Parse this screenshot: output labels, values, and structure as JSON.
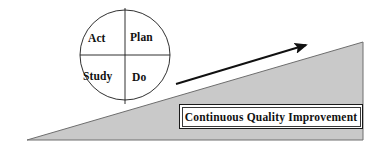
{
  "figure": {
    "background_color": "#ffffff"
  },
  "pdsa_cycle": {
    "name": "PDSA cycle wheel",
    "center_x": 125,
    "center_y": 55,
    "radius": 45,
    "stroke_color": "#1a1a1a",
    "fill_color": "#ffffff",
    "quadrants": [
      {
        "id": "act",
        "label": "Act",
        "position": "top-left"
      },
      {
        "id": "plan",
        "label": "Plan",
        "position": "top-right"
      },
      {
        "id": "study",
        "label": "Study",
        "position": "bottom-left"
      },
      {
        "id": "do",
        "label": "Do",
        "position": "bottom-right"
      }
    ]
  },
  "ramp": {
    "name": "improvement ramp",
    "fill_color": "#c9c9c9",
    "stroke_color": "#6e6e6e",
    "points": "27,140 363,140 363,42"
  },
  "arrow": {
    "name": "upward progress arrow",
    "color": "#111111",
    "start_x": 176,
    "start_y": 84,
    "end_x": 310,
    "end_y": 44
  },
  "callout": {
    "name": "continuous quality improvement label",
    "text": "Continuous Quality Improvement",
    "border_color": "#1a1a1a",
    "background_color": "#ffffff",
    "text_color": "#111111"
  }
}
